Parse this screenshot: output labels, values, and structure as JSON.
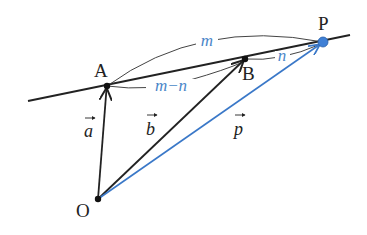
{
  "diagram": {
    "type": "vector-geometry",
    "colors": {
      "line": "#222222",
      "accent": "#3a78c8",
      "label_accent": "#4a86c8",
      "point_p_fill": "#3f80d6"
    },
    "points": {
      "O": {
        "label": "O",
        "x": 98,
        "y": 199
      },
      "A": {
        "label": "A",
        "x": 107,
        "y": 86
      },
      "B": {
        "label": "B",
        "x": 245,
        "y": 59
      },
      "P": {
        "label": "P",
        "x": 323,
        "y": 42
      }
    },
    "line": {
      "x1": 28,
      "y1": 101,
      "x2": 350,
      "y2": 35
    },
    "vectors": [
      {
        "name": "a",
        "label": "a",
        "from": "O",
        "to": "A",
        "color": "#222222"
      },
      {
        "name": "b",
        "label": "b",
        "from": "O",
        "to": "B",
        "color": "#222222"
      },
      {
        "name": "p",
        "label": "p",
        "from": "O",
        "to": "P",
        "color": "#3a78c8"
      }
    ],
    "lengths": [
      {
        "name": "AP",
        "label": "m"
      },
      {
        "name": "AB",
        "label": "m−n"
      },
      {
        "name": "BP",
        "label": "n"
      }
    ],
    "vector_arrow_glyph": "→"
  }
}
